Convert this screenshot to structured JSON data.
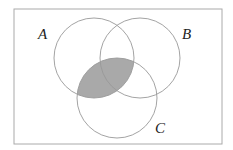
{
  "diagram": {
    "type": "venn",
    "universe": {
      "x": 14,
      "y": 9,
      "w": 208,
      "h": 135
    },
    "sets": [
      {
        "label": "A",
        "cx": 94,
        "cy": 58,
        "r": 40,
        "label_x": 38,
        "label_y": 39
      },
      {
        "label": "B",
        "cx": 140,
        "cy": 58,
        "r": 40,
        "label_x": 182,
        "label_y": 39
      },
      {
        "label": "C",
        "cx": 117,
        "cy": 98,
        "r": 40,
        "label_x": 155,
        "label_y": 133
      }
    ],
    "shaded_region": "A ∩ C",
    "colors": {
      "stroke": "#999999",
      "shade": "#a9a9a9",
      "border": "#aaaaaa"
    }
  }
}
